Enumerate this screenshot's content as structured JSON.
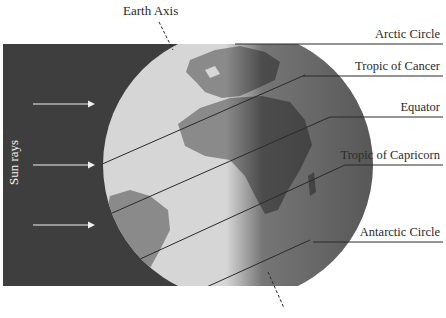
{
  "labels": {
    "earth_axis": "Earth Axis",
    "sun_rays": "Sun rays",
    "arctic_circle": "Arctic Circle",
    "tropic_of_cancer": "Tropic of Cancer",
    "equator": "Equator",
    "tropic_of_capricorn": "Tropic of Capricorn",
    "antarctic_circle": "Antarctic Circle"
  },
  "colors": {
    "space": "#3e3e3e",
    "ocean_lit": "#d6d6d6",
    "land_lit": "#8a8a8a",
    "night_side": "#555555",
    "lines": "#2a2a2a",
    "arrows": "#f0f0f0"
  },
  "arrows": [
    {
      "y": 103
    },
    {
      "y": 165
    },
    {
      "y": 225
    }
  ]
}
